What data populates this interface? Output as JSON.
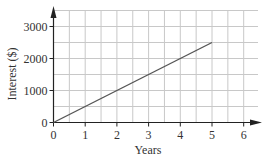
{
  "chart_data": {
    "type": "line",
    "title": "",
    "xlabel": "Years",
    "ylabel": "Interest ($)",
    "x": [
      0,
      5
    ],
    "series": [
      {
        "name": "Interest",
        "values": [
          0,
          2500
        ],
        "color": "#555555"
      }
    ],
    "x_ticks": [
      "0",
      "1",
      "2",
      "3",
      "4",
      "5",
      "6"
    ],
    "y_ticks": [
      "0",
      "1000",
      "2000",
      "3000"
    ],
    "xlim": [
      0,
      6.5
    ],
    "ylim": [
      0,
      3500
    ],
    "grid": true,
    "grid_x_step": 0.5,
    "grid_y_step": 500,
    "legend": "none"
  },
  "colors": {
    "grid": "#c8c8c8",
    "axis": "#222222",
    "line": "#555555",
    "text": "#333333"
  }
}
